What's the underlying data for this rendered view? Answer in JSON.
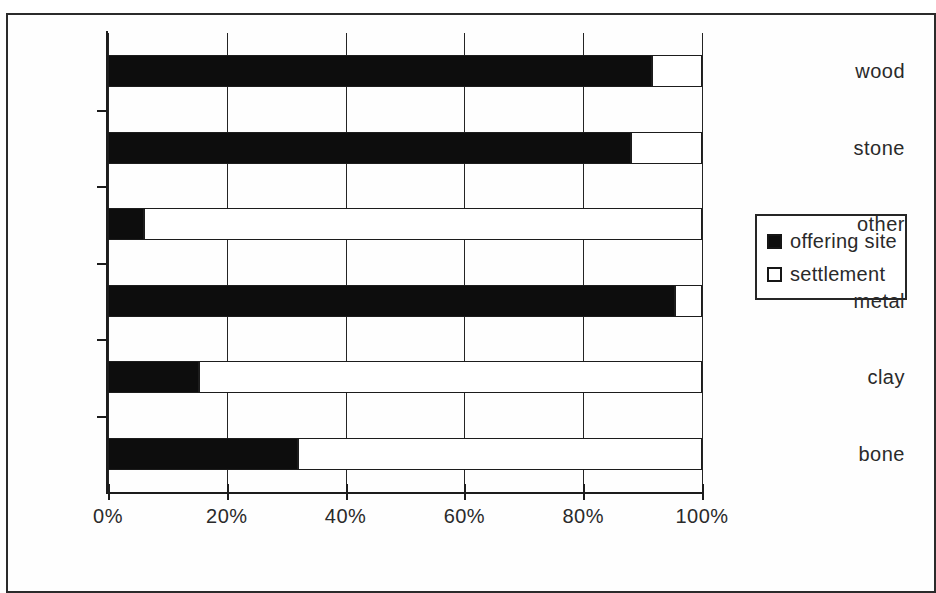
{
  "chart_data": {
    "type": "bar",
    "orientation": "horizontal",
    "stacked": true,
    "normalized": "percent",
    "title": "",
    "subtitle": "",
    "xlabel": "",
    "ylabel": "",
    "xlim": [
      0,
      100
    ],
    "grid": true,
    "legend_position": "right",
    "categories": [
      "wood",
      "stone",
      "other",
      "metal",
      "clay",
      "bone"
    ],
    "x_tick_labels": [
      "0%",
      "20%",
      "40%",
      "60%",
      "80%",
      "100%"
    ],
    "x_tick_values": [
      0,
      20,
      40,
      60,
      80,
      100
    ],
    "series": [
      {
        "name": "offering site",
        "color": "#0d0d0d",
        "values": [
          91.5,
          88,
          6,
          95.5,
          15.3,
          32
        ]
      },
      {
        "name": "settlement",
        "color": "#ffffff",
        "values": [
          8.5,
          12,
          94,
          4.5,
          84.7,
          68
        ]
      }
    ]
  },
  "legend": {
    "items": [
      {
        "label": "offering site",
        "swatch": "filled-square-black"
      },
      {
        "label": "settlement",
        "swatch": "empty-square-white"
      }
    ]
  }
}
